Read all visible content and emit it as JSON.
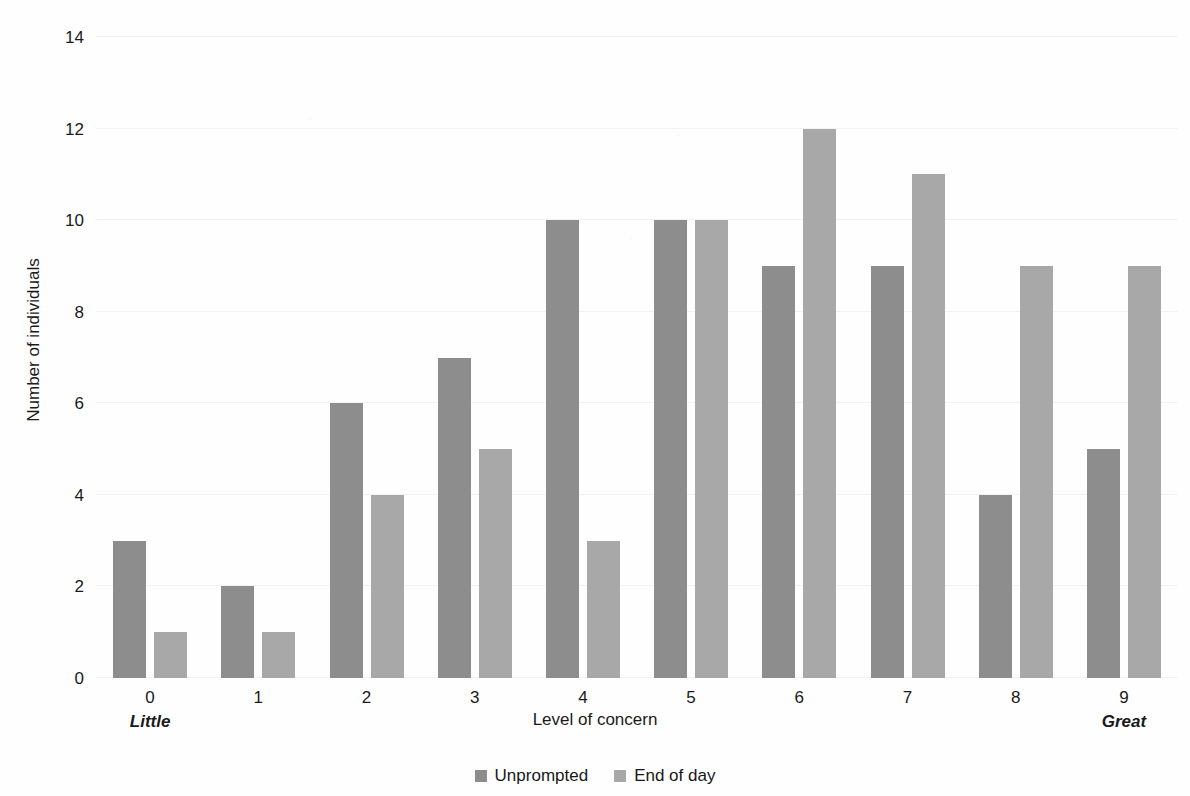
{
  "chart_data": {
    "type": "bar",
    "title": "",
    "subtitle": "",
    "xlabel": "Level of concern",
    "ylabel": "Number of individuals",
    "categories": [
      "0",
      "1",
      "2",
      "3",
      "4",
      "5",
      "6",
      "7",
      "8",
      "9"
    ],
    "category_annotations": {
      "0": "Little",
      "9": "Great"
    },
    "series": [
      {
        "name": "Unprompted",
        "color": "#8d8d8d",
        "values": [
          3,
          2,
          6,
          7,
          10,
          10,
          9,
          9,
          4,
          5
        ]
      },
      {
        "name": "End of day",
        "color": "#a8a8a8",
        "values": [
          1,
          1,
          4,
          5,
          3,
          10,
          12,
          11,
          9,
          9
        ]
      }
    ],
    "ylim": [
      0,
      14
    ],
    "yticks": [
      0,
      2,
      4,
      6,
      8,
      10,
      12,
      14
    ],
    "ytick_labels": [
      "0",
      "2",
      "4",
      "6",
      "8",
      "10",
      "12",
      "14"
    ],
    "xlim_categories": 10,
    "grid": true,
    "grid_axis": "y",
    "legend_position": "bottom",
    "bar_mode": "grouped"
  },
  "axes": {
    "y_title": "Number of individuals",
    "x_title": "Level of concern",
    "x_low_anchor": "Little",
    "x_high_anchor": "Great"
  },
  "legend": {
    "items": [
      {
        "label": "Unprompted",
        "color": "#8d8d8d"
      },
      {
        "label": "End of day",
        "color": "#a8a8a8"
      }
    ]
  }
}
